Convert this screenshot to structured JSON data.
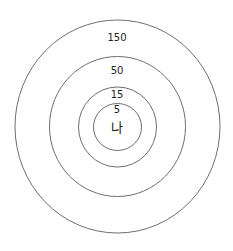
{
  "diagram": {
    "type": "concentric-circles",
    "center_label": "나",
    "rings": [
      {
        "label": "5",
        "rx": 24,
        "ry": 23.5
      },
      {
        "label": "15",
        "rx": 39,
        "ry": 40
      },
      {
        "label": "50",
        "rx": 68,
        "ry": 70
      },
      {
        "label": "150",
        "rx": 102.5,
        "ry": 106.5
      }
    ],
    "stroke_color": "#6e6e6e"
  }
}
